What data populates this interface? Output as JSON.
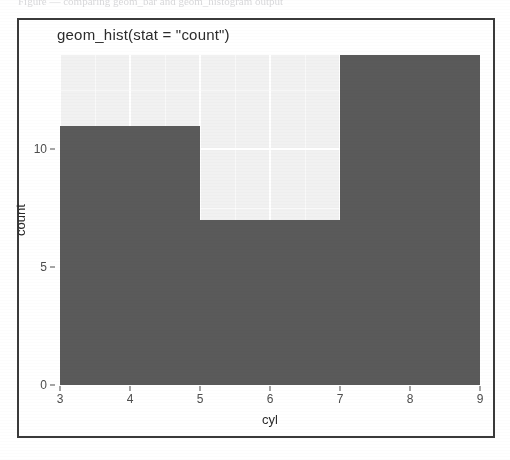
{
  "top_cut_caption": "Figure — comparing geom_bar and geom_histogram output",
  "chart_data": {
    "type": "bar",
    "title": "geom_hist(stat = \"count\")",
    "xlabel": "cyl",
    "ylabel": "count",
    "categories": [
      "4",
      "6",
      "8"
    ],
    "values": [
      11,
      7,
      14
    ],
    "bin_edges": [
      [
        3,
        5
      ],
      [
        5,
        7
      ],
      [
        7,
        9
      ]
    ],
    "xlim": [
      3,
      9
    ],
    "ylim": [
      0,
      14
    ],
    "x_ticks": [
      "3",
      "4",
      "5",
      "6",
      "7",
      "8",
      "9"
    ],
    "x_tick_values": [
      3,
      4,
      5,
      6,
      7,
      8,
      9
    ],
    "y_ticks": [
      "0",
      "5",
      "10"
    ],
    "y_tick_values": [
      0,
      5,
      10
    ],
    "grid": true,
    "legend": "none",
    "bar_color": "#5a5a5a",
    "panel_color": "#f1f1f1",
    "gridline_color": "#ffffff"
  }
}
